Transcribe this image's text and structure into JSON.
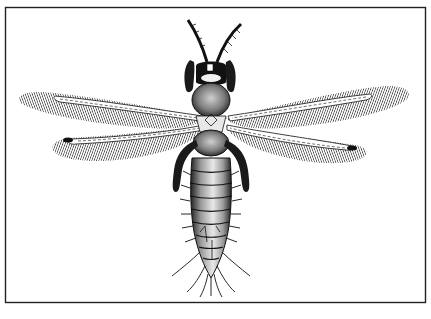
{
  "figure": {
    "style": "black-and-white engraving",
    "colors": {
      "ink": "#111111",
      "paper": "#ffffff",
      "border": "#222222"
    },
    "frame": {
      "x": 5,
      "y": 7,
      "width": 421,
      "height": 296
    }
  }
}
